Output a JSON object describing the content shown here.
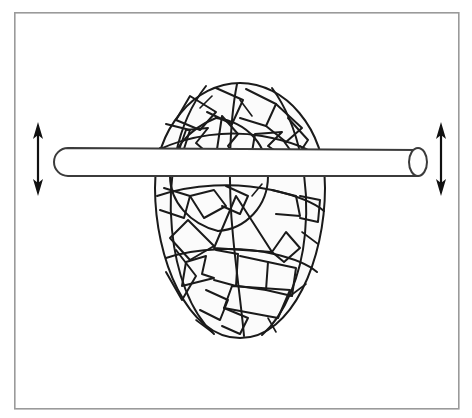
{
  "figure": {
    "title": "Cracked egg-shaped shell pierced by a horizontal rod",
    "caption": "",
    "background_color": "#ffffff",
    "frame": {
      "name": "outer-border",
      "x": 14,
      "y": 12,
      "width": 444,
      "height": 396,
      "stroke_color": "#9a9a9a",
      "fill_color": "#ffffff"
    },
    "shell": {
      "label": "cracked-egg-shell",
      "description": "Ovoid shell covered in irregular fracture fragments",
      "center_x": 240,
      "center_y": 211,
      "radius_x": 85,
      "radius_y": 128,
      "outline_color": "#1a1a1a",
      "fill_color": "#fbfbfb",
      "fragment_count": 46
    },
    "rod": {
      "label": "horizontal-rod",
      "description": "Cylindrical rod passing through the shell horizontally",
      "left_x": 54,
      "right_x": 418,
      "top_y": 148,
      "bottom_y": 176,
      "outline_color": "#3b3b3b",
      "fill_color": "#ffffff",
      "left_end": "rounded",
      "right_end": "open-ellipse"
    },
    "arrows": [
      {
        "name": "left-vertical-double-arrow",
        "label": "",
        "x": 38,
        "y_top": 122,
        "y_bottom": 196,
        "direction": "both",
        "color": "#111111"
      },
      {
        "name": "right-vertical-double-arrow",
        "label": "",
        "x": 441,
        "y_top": 122,
        "y_bottom": 196,
        "direction": "both",
        "color": "#111111"
      }
    ],
    "colors": {
      "ink": "#1a1a1a",
      "rod_ink": "#3b3b3b",
      "frame": "#9a9a9a",
      "paper": "#ffffff",
      "shell_fill": "#fbfbfb"
    }
  }
}
